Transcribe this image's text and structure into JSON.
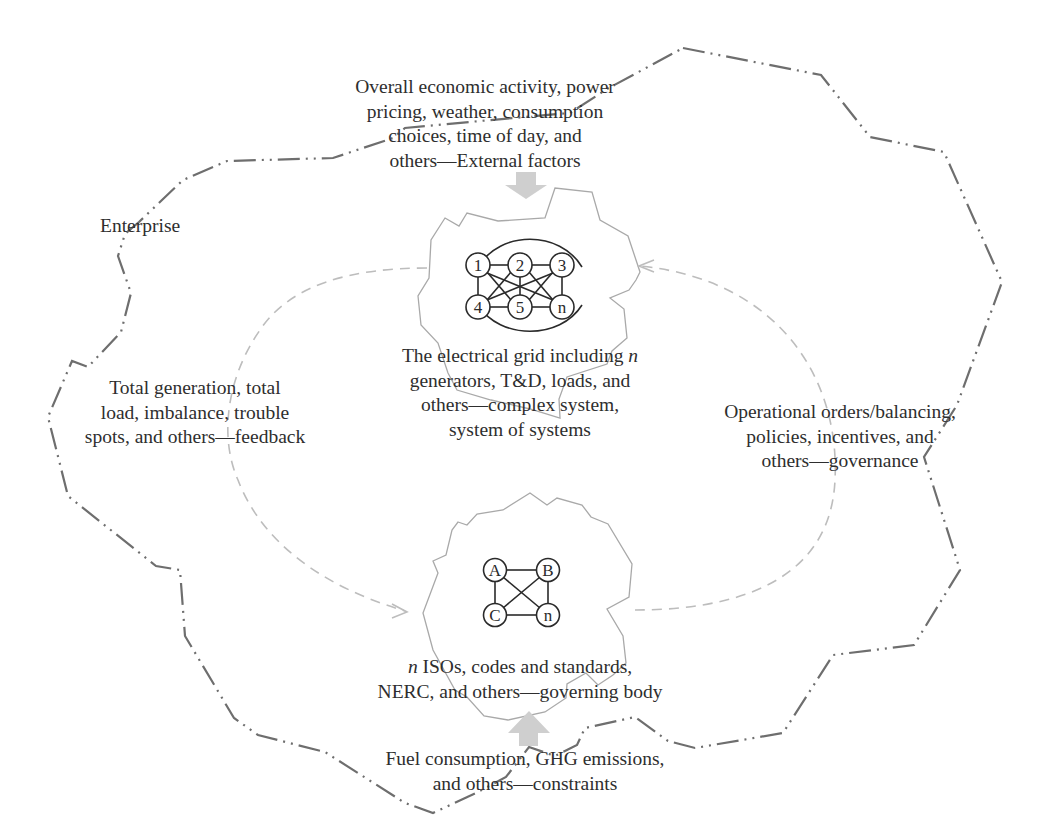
{
  "diagram": {
    "enterprise_label": "Enterprise",
    "external_factors": {
      "lines": [
        "Overall economic activity, power",
        "pricing, weather, consumption",
        "choices, time of day, and",
        "others—External factors"
      ]
    },
    "grid": {
      "lines_prefix": "The electrical grid including ",
      "lines_italic": "n",
      "lines": [
        "generators, T&D, loads, and",
        "others—complex system,",
        "system of systems"
      ],
      "nodes": [
        "1",
        "2",
        "3",
        "4",
        "5",
        "n"
      ]
    },
    "feedback": {
      "lines": [
        "Total generation, total",
        "load, imbalance, trouble",
        "spots, and others—feedback"
      ]
    },
    "governance": {
      "lines": [
        "Operational orders/balancing,",
        "policies, incentives, and",
        "others—governance"
      ]
    },
    "governing_body": {
      "italic_prefix": "n",
      "first_line_rest": " ISOs, codes and standards,",
      "lines": [
        "NERC, and others—governing body"
      ],
      "nodes": [
        "A",
        "B",
        "C",
        "n"
      ]
    },
    "constraints": {
      "lines": [
        "Fuel consumption, GHG emissions,",
        "and others—constraints"
      ]
    },
    "colors": {
      "boundary": "#6e6e6e",
      "cloud": "#a9a9a9",
      "loop_arrow": "#bdbdbd",
      "input_arrow": "#cfcfcf",
      "node_stroke": "#2a2a2a"
    }
  }
}
